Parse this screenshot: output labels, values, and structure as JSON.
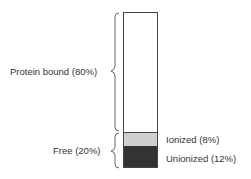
{
  "diagram": {
    "title": "",
    "segments": [
      {
        "name": "Protein bound",
        "percent": 80,
        "label": "Protein bound (80%)",
        "color": "#ffffff"
      },
      {
        "name": "Ionized",
        "percent": 8,
        "label": "Ionized (8%)",
        "color": "#cfcfcf"
      },
      {
        "name": "Unionized",
        "percent": 12,
        "label": "Unionized (12%)",
        "color": "#333333"
      }
    ],
    "groups": [
      {
        "label": "Protein bound (80%)"
      },
      {
        "label": "Free (20%)"
      }
    ]
  }
}
